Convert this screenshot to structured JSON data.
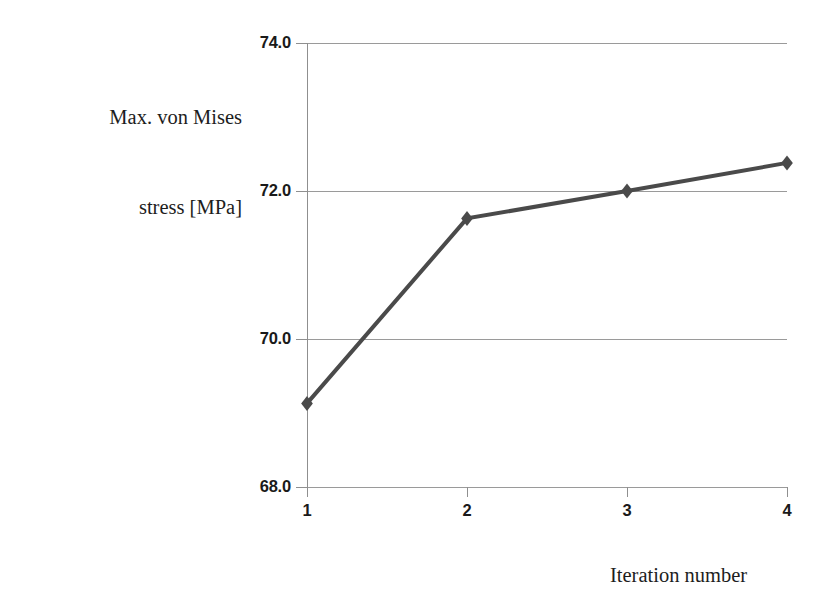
{
  "chart_data": {
    "type": "line",
    "title": "",
    "subtitle": "",
    "xlabel": "Iteration number",
    "ylabel": "Max. von Mises stress [MPa]",
    "ylabel_lines": [
      "Max. von Mises",
      "stress [MPa]"
    ],
    "x": [
      1,
      2,
      3,
      4
    ],
    "categories": [
      "1",
      "2",
      "3",
      "4"
    ],
    "values": [
      69.13,
      71.63,
      72.0,
      72.38
    ],
    "series": [
      {
        "name": "Max. von Mises stress",
        "values": [
          69.13,
          71.63,
          72.0,
          72.38
        ],
        "color": "#4a4a4a",
        "marker": "diamond",
        "line_width": 4
      }
    ],
    "xlim": [
      1,
      4
    ],
    "ylim": [
      68.0,
      74.0
    ],
    "y_ticks": [
      68.0,
      70.0,
      72.0,
      74.0
    ],
    "y_tick_labels": [
      "68.0",
      "70.0",
      "72.0",
      "74.0"
    ],
    "x_ticks": [
      1,
      2,
      3,
      4
    ],
    "x_tick_labels": [
      "1",
      "2",
      "3",
      "4"
    ],
    "grid": "horizontal",
    "legend": "none",
    "gridline_color": "#9a9a9a",
    "axis_color": "#8f8f8f",
    "background": "#ffffff"
  }
}
